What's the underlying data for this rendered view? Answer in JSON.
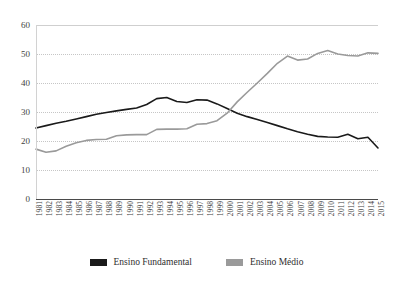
{
  "chart_data": {
    "type": "line",
    "title": "",
    "xlabel": "",
    "ylabel": "",
    "ylim": [
      0,
      60
    ],
    "yticks": [
      0,
      10,
      20,
      30,
      40,
      50,
      60
    ],
    "grid": true,
    "legend_position": "bottom",
    "categories": [
      "1981",
      "1982",
      "1983",
      "1984",
      "1985",
      "1986",
      "1987",
      "1988",
      "1989",
      "1990",
      "1991",
      "1992",
      "1993",
      "1994",
      "1995",
      "1996",
      "1997",
      "1998",
      "1999",
      "2000",
      "2001",
      "2002",
      "2003",
      "2004",
      "2005",
      "2006",
      "2007",
      "2008",
      "2009",
      "2010",
      "2011",
      "2012",
      "2013",
      "2014",
      "2015"
    ],
    "series": [
      {
        "name": "Ensino Fundamental",
        "color": "#1a1a1a",
        "values": [
          24.5,
          25.3,
          26.1,
          26.8,
          27.6,
          28.4,
          29.2,
          29.8,
          30.4,
          30.9,
          31.4,
          32.6,
          34.6,
          35.0,
          33.6,
          33.3,
          34.2,
          34.1,
          32.8,
          31.2,
          29.6,
          28.4,
          27.4,
          26.4,
          25.3,
          24.2,
          23.2,
          22.3,
          21.6,
          21.4,
          21.3,
          22.3,
          20.8,
          21.3,
          17.6
        ]
      },
      {
        "name": "Ensino Médio",
        "color": "#9a9a9a",
        "values": [
          17.2,
          16.1,
          16.6,
          18.2,
          19.4,
          20.2,
          20.5,
          20.6,
          21.8,
          22.1,
          22.2,
          22.2,
          24.0,
          24.1,
          24.1,
          24.2,
          25.8,
          26.0,
          27.0,
          29.6,
          33.5,
          36.8,
          40.0,
          43.3,
          46.8,
          49.3,
          47.9,
          48.3,
          50.2,
          51.2,
          50.0,
          49.5,
          49.3,
          50.4,
          50.2
        ]
      }
    ]
  },
  "legend": {
    "items": [
      {
        "label": "Ensino Fundamental",
        "color": "#1a1a1a"
      },
      {
        "label": "Ensino Médio",
        "color": "#9a9a9a"
      }
    ]
  }
}
